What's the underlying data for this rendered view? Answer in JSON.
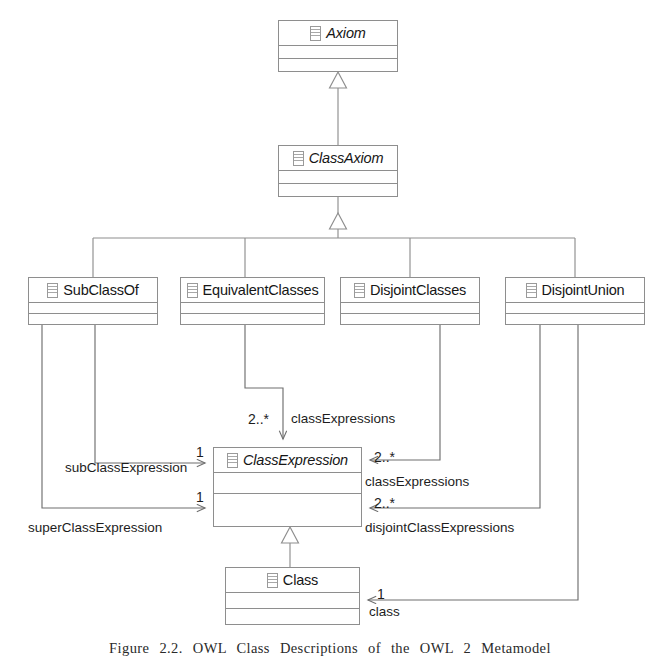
{
  "diagram": {
    "kind": "uml-class-diagram",
    "classes": [
      {
        "id": "axiom",
        "name": "Axiom",
        "abstract": true,
        "icon": "class-stereotype-icon"
      },
      {
        "id": "classAxiom",
        "name": "ClassAxiom",
        "abstract": true,
        "icon": "class-stereotype-icon"
      },
      {
        "id": "subClassOf",
        "name": "SubClassOf",
        "abstract": false,
        "icon": "class-stereotype-icon"
      },
      {
        "id": "equivalentClasses",
        "name": "EquivalentClasses",
        "abstract": false,
        "icon": "class-stereotype-icon"
      },
      {
        "id": "disjointClasses",
        "name": "DisjointClasses",
        "abstract": false,
        "icon": "class-stereotype-icon"
      },
      {
        "id": "disjointUnion",
        "name": "DisjointUnion",
        "abstract": false,
        "icon": "class-stereotype-icon"
      },
      {
        "id": "classExpression",
        "name": "ClassExpression",
        "abstract": true,
        "icon": "class-stereotype-icon"
      },
      {
        "id": "classBox",
        "name": "Class",
        "abstract": false,
        "icon": "class-stereotype-icon"
      }
    ],
    "generalizations": [
      {
        "from": "classAxiom",
        "to": "axiom"
      },
      {
        "from": "subClassOf",
        "to": "classAxiom"
      },
      {
        "from": "equivalentClasses",
        "to": "classAxiom"
      },
      {
        "from": "disjointClasses",
        "to": "classAxiom"
      },
      {
        "from": "disjointUnion",
        "to": "classAxiom"
      },
      {
        "from": "classBox",
        "to": "classExpression"
      }
    ],
    "associations": [
      {
        "id": "subClassExpression",
        "from": "subClassOf",
        "to": "classExpression",
        "role": "subClassExpression",
        "multiplicity": "1"
      },
      {
        "id": "superClassExpression",
        "from": "subClassOf",
        "to": "classExpression",
        "role": "superClassExpression",
        "multiplicity": "1"
      },
      {
        "id": "equivClassExpressions",
        "from": "equivalentClasses",
        "to": "classExpression",
        "role": "classExpressions",
        "multiplicity": "2..*"
      },
      {
        "id": "disjointClassExpressions1",
        "from": "disjointClasses",
        "to": "classExpression",
        "role": "classExpressions",
        "multiplicity": "2..*"
      },
      {
        "id": "disjointClassExpressions2",
        "from": "disjointUnion",
        "to": "classExpression",
        "role": "disjointClassExpressions",
        "multiplicity": "2..*"
      },
      {
        "id": "unionClass",
        "from": "disjointUnion",
        "to": "classBox",
        "role": "class",
        "multiplicity": "1"
      }
    ],
    "colors": {
      "line": "#8e8e8e",
      "edge": "#6f6f6f",
      "text": "#1d1d1d",
      "background": "#ffffff"
    }
  },
  "caption": {
    "text": "Figure 2.2.    OWL Class Descriptions of the OWL 2 Metamodel"
  }
}
